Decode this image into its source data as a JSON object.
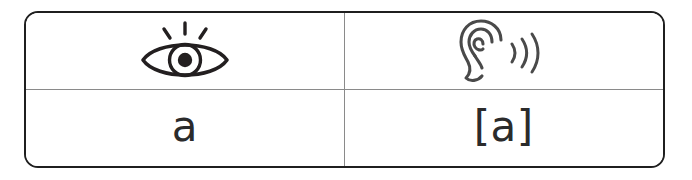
{
  "table": {
    "rows": [
      {
        "cells": [
          {
            "type": "icon",
            "icon": "eye-icon",
            "label": "eye",
            "alt_text": ""
          },
          {
            "type": "icon",
            "icon": "ear-icon",
            "label": "ear with sound waves",
            "alt_text": ""
          }
        ]
      },
      {
        "cells": [
          {
            "type": "text",
            "value": "a"
          },
          {
            "type": "text",
            "value": "[a]"
          }
        ]
      }
    ]
  },
  "colors": {
    "outer_border": "#1f1f1f",
    "inner_divider": "#8a8a8a",
    "ink": "#2b2b2b",
    "background": "#ffffff"
  }
}
